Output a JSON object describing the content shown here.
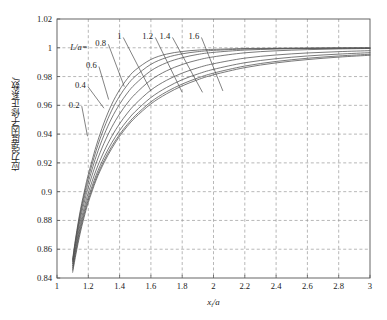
{
  "page": {
    "top_fragment": "",
    "background": "#ffffff"
  },
  "axes": {
    "x_label": "x",
    "x_label_sub": "i",
    "x_label_den": "/a",
    "y_label": "应力强度因子修正系数",
    "y_label_symbol": "f",
    "x_ticks": [
      "1",
      "1.2",
      "1.4",
      "1.6",
      "1.8",
      "2",
      "2.2",
      "2.4",
      "2.6",
      "2.8",
      "3"
    ],
    "y_ticks": [
      "0.84",
      "0.86",
      "0.88",
      "0.9",
      "0.92",
      "0.94",
      "0.96",
      "0.98",
      "1",
      "1.02"
    ]
  },
  "annotations": {
    "legend_prefix": "L/a=",
    "curve_labels": [
      "0.2",
      "0.4",
      "0.6",
      "0.8",
      "1",
      "1.2",
      "1.4",
      "1.6"
    ]
  },
  "colors": {
    "curve": "#4d4d4d",
    "grid": "#9a9a9a",
    "frame": "#555555",
    "text": "#1a1a1a"
  },
  "chart_data": {
    "type": "line",
    "title": "",
    "xlabel": "x_i/a",
    "ylabel": "应力强度因子修正系数 f",
    "xlim": [
      1,
      3
    ],
    "ylim": [
      0.84,
      1.02
    ],
    "grid": true,
    "legend": "inline-labels",
    "x": [
      1.1,
      1.12,
      1.15,
      1.18,
      1.2,
      1.25,
      1.3,
      1.35,
      1.4,
      1.45,
      1.5,
      1.6,
      1.7,
      1.8,
      1.9,
      2.0,
      2.2,
      2.4,
      2.6,
      2.8,
      3.0
    ],
    "series": [
      {
        "name": "L/a=0.2",
        "label": "0.2",
        "values": [
          0.844,
          0.856,
          0.872,
          0.885,
          0.8925,
          0.908,
          0.92,
          0.93,
          0.9385,
          0.9455,
          0.9515,
          0.961,
          0.968,
          0.9735,
          0.9778,
          0.9812,
          0.9862,
          0.9895,
          0.9918,
          0.9935,
          0.9948
        ]
      },
      {
        "name": "L/a=0.4",
        "label": "0.4",
        "values": [
          0.8455,
          0.858,
          0.874,
          0.8868,
          0.8942,
          0.9095,
          0.9215,
          0.9315,
          0.9398,
          0.9468,
          0.9528,
          0.9624,
          0.9694,
          0.9748,
          0.979,
          0.9824,
          0.9873,
          0.9905,
          0.9927,
          0.9943,
          0.9955
        ]
      },
      {
        "name": "L/a=0.6",
        "label": "0.6",
        "values": [
          0.847,
          0.8598,
          0.876,
          0.8888,
          0.8962,
          0.9115,
          0.9238,
          0.934,
          0.9425,
          0.9496,
          0.9557,
          0.9654,
          0.9724,
          0.9778,
          0.9818,
          0.985,
          0.9896,
          0.9924,
          0.9943,
          0.9956,
          0.9966
        ]
      },
      {
        "name": "L/a=0.8",
        "label": "0.8",
        "values": [
          0.8485,
          0.8618,
          0.8785,
          0.8915,
          0.8992,
          0.915,
          0.9278,
          0.9385,
          0.9472,
          0.9546,
          0.9608,
          0.9706,
          0.9774,
          0.9824,
          0.9861,
          0.9889,
          0.9928,
          0.995,
          0.9964,
          0.9973,
          0.998
        ]
      },
      {
        "name": "L/a=1",
        "label": "1",
        "values": [
          0.85,
          0.864,
          0.8815,
          0.895,
          0.903,
          0.9198,
          0.9335,
          0.9448,
          0.954,
          0.9616,
          0.9679,
          0.9776,
          0.984,
          0.9884,
          0.9915,
          0.9937,
          0.9965,
          0.9979,
          0.9987,
          0.9992,
          0.9995
        ]
      },
      {
        "name": "L/a=1.2",
        "label": "1.2",
        "values": [
          0.8512,
          0.8658,
          0.884,
          0.8982,
          0.9066,
          0.9245,
          0.9392,
          0.9512,
          0.9608,
          0.9686,
          0.9748,
          0.984,
          0.9896,
          0.9931,
          0.9954,
          0.9968,
          0.9984,
          0.9991,
          0.9995,
          0.9997,
          0.9998
        ]
      },
      {
        "name": "L/a=1.4",
        "label": "1.4",
        "values": [
          0.8522,
          0.8672,
          0.886,
          0.9008,
          0.9096,
          0.9285,
          0.944,
          0.9566,
          0.9664,
          0.9742,
          0.9802,
          0.9885,
          0.9932,
          0.9958,
          0.9973,
          0.9982,
          0.9991,
          0.9995,
          0.9997,
          0.9998,
          0.9999
        ]
      },
      {
        "name": "L/a=1.6",
        "label": "1.6",
        "values": [
          0.853,
          0.8684,
          0.8876,
          0.9028,
          0.912,
          0.9316,
          0.9478,
          0.9608,
          0.9708,
          0.9786,
          0.9845,
          0.9919,
          0.9956,
          0.9974,
          0.9984,
          0.9989,
          0.9995,
          0.9997,
          0.9998,
          0.9999,
          0.9999
        ]
      }
    ],
    "label_leaders": [
      {
        "label": "0.2",
        "text_x": 1.075,
        "text_y": 0.9605,
        "tip_x": 1.195,
        "tip_y": 0.9385
      },
      {
        "label": "0.4",
        "text_x": 1.115,
        "text_y": 0.974,
        "tip_x": 1.3,
        "tip_y": 0.958
      },
      {
        "label": "0.6",
        "text_x": 1.185,
        "text_y": 0.988,
        "tip_x": 1.33,
        "tip_y": 0.964
      },
      {
        "label": "0.8",
        "text_x": 1.245,
        "text_y": 1.0035,
        "tip_x": 1.43,
        "tip_y": 0.973
      },
      {
        "label": "1",
        "text_x": 1.385,
        "text_y": 1.0082,
        "tip_x": 1.6,
        "tip_y": 0.97
      },
      {
        "label": "1.2",
        "text_x": 1.545,
        "text_y": 1.0082,
        "tip_x": 1.8,
        "tip_y": 0.969
      },
      {
        "label": "1.4",
        "text_x": 1.655,
        "text_y": 1.0082,
        "tip_x": 1.93,
        "tip_y": 0.969
      },
      {
        "label": "1.6",
        "text_x": 1.84,
        "text_y": 1.0082,
        "tip_x": 2.06,
        "tip_y": 0.97
      }
    ]
  }
}
